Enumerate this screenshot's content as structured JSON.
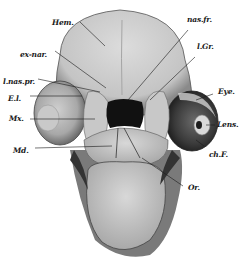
{
  "figure": {
    "colors": {
      "tissue_light": "#d6d6d6",
      "tissue_mid": "#b9b9b9",
      "tissue_dark": "#5a5a5a",
      "cavity": "#111111",
      "ink": "#1a1a1a"
    },
    "labels": [
      {
        "id": "hem",
        "text": "Hem."
      },
      {
        "id": "ex-nar",
        "text": "ex-nar."
      },
      {
        "id": "l-nas-pr",
        "text": "l.nas.pr."
      },
      {
        "id": "el",
        "text": "E.l."
      },
      {
        "id": "mx",
        "text": "Mx."
      },
      {
        "id": "md",
        "text": "Md."
      },
      {
        "id": "nas-fr",
        "text": "nas.fr."
      },
      {
        "id": "l-gr",
        "text": "l.Gr."
      },
      {
        "id": "eye",
        "text": "Eye."
      },
      {
        "id": "lens",
        "text": "Lens."
      },
      {
        "id": "ch-f",
        "text": "ch.F."
      },
      {
        "id": "or",
        "text": "Or."
      }
    ]
  }
}
